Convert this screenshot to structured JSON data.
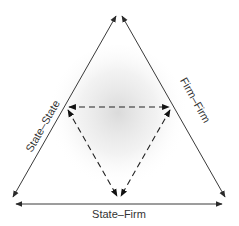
{
  "diagram": {
    "type": "triangle-relations",
    "colors": {
      "line": "#3a3a3a",
      "dashed_line": "#333333",
      "shading": "#d9d9d9",
      "text": "#333333",
      "background": "#ffffff"
    },
    "outer_triangle": {
      "vertices": {
        "top": [
          119,
          14
        ],
        "bottom_left": [
          12,
          200
        ],
        "bottom_right": [
          226,
          200
        ]
      },
      "edges": [
        {
          "id": "left",
          "label": "State–State",
          "style": "solid",
          "arrows": "both"
        },
        {
          "id": "right",
          "label": "Firm–Firm",
          "style": "solid",
          "arrows": "both"
        },
        {
          "id": "bottom",
          "label": "State–Firm",
          "style": "solid",
          "arrows": "both"
        }
      ]
    },
    "inner_triangle": {
      "vertices": {
        "top_left": [
          67,
          107
        ],
        "top_right": [
          171,
          107
        ],
        "bottom": [
          119,
          197
        ]
      },
      "style": "dashed",
      "arrows": "both"
    },
    "labels": {
      "left": "State–State",
      "right": "Firm–Firm",
      "bottom": "State–Firm"
    }
  }
}
